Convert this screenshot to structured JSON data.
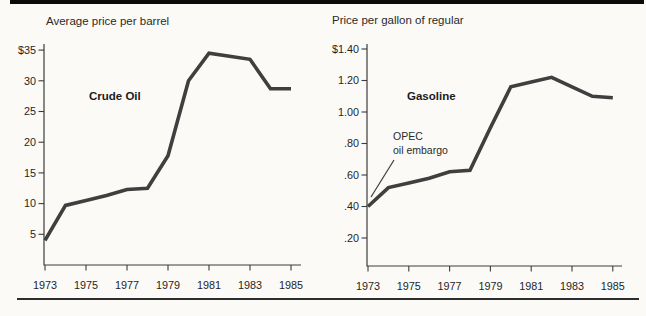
{
  "chart_data": [
    {
      "type": "line",
      "title": "Crude Oil",
      "axis_label": "Average price per barrel",
      "x": [
        1973,
        1974,
        1975,
        1976,
        1977,
        1978,
        1979,
        1980,
        1981,
        1982,
        1983,
        1984,
        1985
      ],
      "values": [
        4.0,
        9.7,
        10.5,
        11.3,
        12.3,
        12.5,
        17.8,
        30.0,
        34.5,
        34.0,
        33.5,
        28.7,
        28.7
      ],
      "xtick_labels": [
        "1973",
        "1975",
        "1977",
        "1979",
        "1981",
        "1983",
        "1985"
      ],
      "ytick_labels": [
        "$35",
        "30",
        "25",
        "20",
        "15",
        "10",
        "5"
      ],
      "ytick_values": [
        35,
        30,
        25,
        20,
        15,
        10,
        5
      ],
      "xlim": [
        1973,
        1985
      ],
      "ylim": [
        0,
        36
      ],
      "grid": false,
      "legend": "none",
      "line_color": "#3f3f3f"
    },
    {
      "type": "line",
      "title": "Gasoline",
      "axis_label": "Price per gallon of regular",
      "x": [
        1973,
        1974,
        1975,
        1976,
        1977,
        1978,
        1979,
        1980,
        1981,
        1982,
        1983,
        1984,
        1985
      ],
      "values": [
        0.4,
        0.52,
        0.55,
        0.58,
        0.62,
        0.63,
        0.9,
        1.16,
        1.19,
        1.22,
        1.16,
        1.1,
        1.09
      ],
      "xtick_labels": [
        "1973",
        "1975",
        "1977",
        "1979",
        "1981",
        "1983",
        "1985"
      ],
      "ytick_labels": [
        "$1.40",
        "1.20",
        "1.00",
        ".80",
        ".60",
        ".40",
        ".20"
      ],
      "ytick_values": [
        1.4,
        1.2,
        1.0,
        0.8,
        0.6,
        0.4,
        0.2
      ],
      "xlim": [
        1973,
        1985
      ],
      "ylim": [
        0,
        1.45
      ],
      "grid": false,
      "legend": "none",
      "line_color": "#3f3f3f",
      "annotation": {
        "line1": "OPEC",
        "line2": "oil embargo",
        "points_to": {
          "year": 1973,
          "value": 0.42
        }
      }
    }
  ]
}
